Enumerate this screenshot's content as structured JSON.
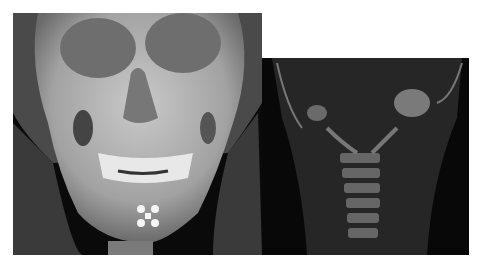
{
  "figure": {
    "panels": [
      {
        "id": "left",
        "description": "3D volume-rendered CT of skull, frontal view",
        "background": "#0a0a0a"
      },
      {
        "id": "right",
        "description": "Coronal CT slice of cervical spine",
        "background": "#080808"
      }
    ]
  }
}
